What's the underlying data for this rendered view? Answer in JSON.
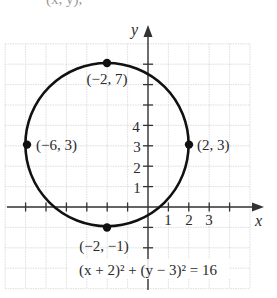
{
  "header_fragment": "(x, y),",
  "figure": {
    "equation_label": "(x + 2)² + (y − 3)² = 16",
    "axis_x_label": "x",
    "axis_y_label": "y",
    "x_ticks_labels": [
      "1",
      "2",
      "3"
    ],
    "y_ticks_labels": [
      "1",
      "2",
      "3",
      "4"
    ],
    "center": {
      "x": -2,
      "y": 3
    },
    "radius": 4,
    "points": [
      {
        "x": -2,
        "y": 7,
        "label": "(−2, 7)"
      },
      {
        "x": -6,
        "y": 3,
        "label": "(−6, 3)"
      },
      {
        "x": 2,
        "y": 3,
        "label": "(2, 3)"
      },
      {
        "x": -2,
        "y": -1,
        "label": "(−2, −1)"
      }
    ],
    "colors": {
      "curve": "#111111",
      "axis": "#333333",
      "grid": "#d4d4d4"
    }
  },
  "chart_data": {
    "type": "scatter",
    "title": "(x + 2)² + (y − 3)² = 16",
    "xlabel": "x",
    "ylabel": "y",
    "xlim": [
      -7,
      5
    ],
    "ylim": [
      -4,
      8
    ],
    "grid": true,
    "series": [
      {
        "name": "circle",
        "shape": "circle",
        "center": [
          -2,
          3
        ],
        "radius": 4
      },
      {
        "name": "labeled points",
        "x": [
          -2,
          -6,
          2,
          -2
        ],
        "y": [
          7,
          3,
          3,
          -1
        ],
        "labels": [
          "(−2, 7)",
          "(−6, 3)",
          "(2, 3)",
          "(−2, −1)"
        ]
      }
    ],
    "x_tick_labels": [
      "1",
      "2",
      "3"
    ],
    "y_tick_labels": [
      "1",
      "2",
      "3",
      "4"
    ]
  }
}
